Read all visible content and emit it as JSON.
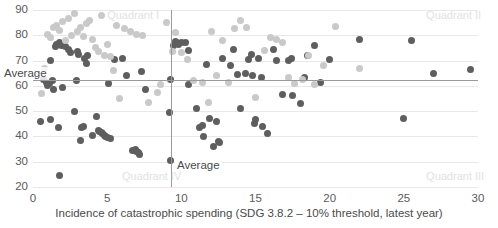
{
  "chart_data": {
    "type": "scatter",
    "title": "",
    "xlabel": "Incidence of catastrophic spending (SDG 3.8.2 – 10% threshold, latest year)",
    "ylabel": "",
    "xlim": [
      0,
      30
    ],
    "ylim": [
      20,
      90
    ],
    "xticks": [
      0,
      5,
      10,
      15,
      20,
      25,
      30
    ],
    "yticks": [
      20,
      30,
      40,
      50,
      60,
      70,
      80,
      90
    ],
    "grid": "horizontal",
    "legend": "none",
    "reference_lines": [
      {
        "name": "vertical-average",
        "axis": "x",
        "value": 9.3,
        "label": "Average"
      },
      {
        "name": "horizontal-average",
        "axis": "y",
        "value": 62.5,
        "label": "Average"
      }
    ],
    "annotations": [
      {
        "name": "quadrant-1",
        "text": "Quadrant I",
        "x": 5.0,
        "y": 87.5
      },
      {
        "name": "quadrant-2",
        "text": "Quadrant II",
        "x": 26.5,
        "y": 87.5
      },
      {
        "name": "quadrant-3",
        "text": "Quadrant III",
        "x": 26.5,
        "y": 24.0
      },
      {
        "name": "quadrant-4",
        "text": "Quadrant IV",
        "x": 6.0,
        "y": 24.0
      }
    ],
    "colors": {
      "series_dark": "#5e5e5e",
      "series_light": "#c9c9c9",
      "gridline": "#e8e8e8",
      "reference_line": "#9a9a9a",
      "quadrant_label": "#e2e2e2",
      "tick_label": "#5a5a5a",
      "background": "#ffffff"
    },
    "series": [
      {
        "name": "dark-series",
        "color": "#5e5e5e",
        "points": [
          [
            0.5,
            46.0
          ],
          [
            0.7,
            62.5
          ],
          [
            0.9,
            61.5
          ],
          [
            1.0,
            60.0
          ],
          [
            1.1,
            61.0
          ],
          [
            1.2,
            46.5
          ],
          [
            1.2,
            70.0
          ],
          [
            1.3,
            62.0
          ],
          [
            1.4,
            58.5
          ],
          [
            1.5,
            75.5
          ],
          [
            1.6,
            76.5
          ],
          [
            1.7,
            43.5
          ],
          [
            1.8,
            77.0
          ],
          [
            1.8,
            24.5
          ],
          [
            1.9,
            76.0
          ],
          [
            2.0,
            59.5
          ],
          [
            2.2,
            75.5
          ],
          [
            2.4,
            74.5
          ],
          [
            2.5,
            73.0
          ],
          [
            2.8,
            50.0
          ],
          [
            2.9,
            62.0
          ],
          [
            3.0,
            73.5
          ],
          [
            3.1,
            72.5
          ],
          [
            3.2,
            38.5
          ],
          [
            3.3,
            43.5
          ],
          [
            3.4,
            44.0
          ],
          [
            3.5,
            71.0
          ],
          [
            3.6,
            69.0
          ],
          [
            3.7,
            72.0
          ],
          [
            4.0,
            40.5
          ],
          [
            4.3,
            48.0
          ],
          [
            4.4,
            42.5
          ],
          [
            4.5,
            42.0
          ],
          [
            4.6,
            41.5
          ],
          [
            4.7,
            41.0
          ],
          [
            4.8,
            40.5
          ],
          [
            4.9,
            40.0
          ],
          [
            5.0,
            39.5
          ],
          [
            5.1,
            61.0
          ],
          [
            5.2,
            39.0
          ],
          [
            5.5,
            70.5
          ],
          [
            6.0,
            71.0
          ],
          [
            6.3,
            64.0
          ],
          [
            6.7,
            34.5
          ],
          [
            6.9,
            35.0
          ],
          [
            7.0,
            34.0
          ],
          [
            7.1,
            33.5
          ],
          [
            7.2,
            33.0
          ],
          [
            7.3,
            65.5
          ],
          [
            7.6,
            58.5
          ],
          [
            9.2,
            49.5
          ],
          [
            9.3,
            30.5
          ],
          [
            9.3,
            62.5
          ],
          [
            9.5,
            76.0
          ],
          [
            9.6,
            77.5
          ],
          [
            9.7,
            77.0
          ],
          [
            9.8,
            76.5
          ],
          [
            10.0,
            77.0
          ],
          [
            10.3,
            77.0
          ],
          [
            10.5,
            74.0
          ],
          [
            10.5,
            60.5
          ],
          [
            11.0,
            51.0
          ],
          [
            11.2,
            43.5
          ],
          [
            11.4,
            44.5
          ],
          [
            11.5,
            40.0
          ],
          [
            11.7,
            68.5
          ],
          [
            11.9,
            47.0
          ],
          [
            12.2,
            36.0
          ],
          [
            12.4,
            46.0
          ],
          [
            12.5,
            38.0
          ],
          [
            12.6,
            37.5
          ],
          [
            12.8,
            71.0
          ],
          [
            13.3,
            68.0
          ],
          [
            13.5,
            74.5
          ],
          [
            13.8,
            64.5
          ],
          [
            14.0,
            51.0
          ],
          [
            14.3,
            65.0
          ],
          [
            14.5,
            70.5
          ],
          [
            14.7,
            72.5
          ],
          [
            14.8,
            64.0
          ],
          [
            14.9,
            45.0
          ],
          [
            15.0,
            46.5
          ],
          [
            15.2,
            71.0
          ],
          [
            15.4,
            63.5
          ],
          [
            15.5,
            44.0
          ],
          [
            15.8,
            41.0
          ],
          [
            16.2,
            74.5
          ],
          [
            16.4,
            70.0
          ],
          [
            16.8,
            56.5
          ],
          [
            17.2,
            70.0
          ],
          [
            17.4,
            71.0
          ],
          [
            17.5,
            56.0
          ],
          [
            18.0,
            53.0
          ],
          [
            18.3,
            63.5
          ],
          [
            18.5,
            72.0
          ],
          [
            19.0,
            76.0
          ],
          [
            19.4,
            61.5
          ],
          [
            20.0,
            70.5
          ],
          [
            22.0,
            78.5
          ],
          [
            25.0,
            47.0
          ],
          [
            25.5,
            78.0
          ],
          [
            27.0,
            65.0
          ],
          [
            29.5,
            66.5
          ]
        ]
      },
      {
        "name": "light-series",
        "color": "#c9c9c9",
        "points": [
          [
            0.6,
            57.0
          ],
          [
            0.8,
            67.0
          ],
          [
            1.0,
            80.5
          ],
          [
            1.2,
            79.0
          ],
          [
            1.4,
            83.0
          ],
          [
            1.6,
            84.0
          ],
          [
            1.8,
            82.0
          ],
          [
            2.0,
            85.5
          ],
          [
            2.2,
            78.0
          ],
          [
            2.4,
            86.5
          ],
          [
            2.6,
            80.0
          ],
          [
            2.8,
            88.5
          ],
          [
            3.0,
            81.5
          ],
          [
            3.2,
            83.0
          ],
          [
            3.4,
            79.5
          ],
          [
            3.6,
            84.5
          ],
          [
            3.8,
            86.0
          ],
          [
            4.0,
            78.5
          ],
          [
            4.2,
            75.0
          ],
          [
            4.4,
            73.5
          ],
          [
            4.6,
            88.0
          ],
          [
            4.8,
            72.0
          ],
          [
            5.0,
            76.5
          ],
          [
            5.2,
            71.5
          ],
          [
            5.4,
            66.0
          ],
          [
            5.6,
            84.0
          ],
          [
            5.8,
            55.0
          ],
          [
            6.2,
            82.5
          ],
          [
            6.6,
            81.5
          ],
          [
            7.0,
            80.5
          ],
          [
            7.4,
            80.0
          ],
          [
            7.8,
            53.5
          ],
          [
            8.4,
            57.5
          ],
          [
            8.6,
            60.5
          ],
          [
            9.0,
            85.0
          ],
          [
            9.4,
            73.5
          ],
          [
            9.6,
            81.0
          ],
          [
            10.0,
            73.0
          ],
          [
            10.4,
            70.5
          ],
          [
            10.8,
            62.0
          ],
          [
            11.4,
            61.5
          ],
          [
            11.8,
            53.5
          ],
          [
            12.0,
            81.5
          ],
          [
            12.4,
            64.0
          ],
          [
            12.8,
            78.0
          ],
          [
            13.2,
            61.5
          ],
          [
            13.6,
            82.5
          ],
          [
            14.0,
            86.0
          ],
          [
            14.4,
            83.0
          ],
          [
            15.0,
            55.5
          ],
          [
            15.6,
            74.0
          ],
          [
            16.0,
            79.0
          ],
          [
            16.4,
            78.5
          ],
          [
            16.8,
            77.0
          ],
          [
            17.2,
            63.5
          ],
          [
            17.6,
            61.0
          ],
          [
            18.2,
            62.5
          ],
          [
            18.6,
            72.0
          ],
          [
            19.0,
            60.5
          ],
          [
            19.6,
            68.0
          ],
          [
            20.4,
            83.5
          ],
          [
            22.0,
            67.0
          ]
        ]
      }
    ]
  }
}
